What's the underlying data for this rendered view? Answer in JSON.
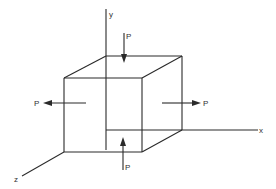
{
  "diagram": {
    "colors": {
      "line": "#2a2a2a",
      "text": "#333333",
      "background": "#ffffff"
    },
    "axes": {
      "x": {
        "label": "x"
      },
      "y": {
        "label": "y"
      },
      "z": {
        "label": "z"
      }
    },
    "forces": {
      "top": {
        "label": "P",
        "direction": "down"
      },
      "bottom": {
        "label": "P",
        "direction": "up"
      },
      "left": {
        "label": "P",
        "direction": "left"
      },
      "right": {
        "label": "P",
        "direction": "right"
      }
    }
  }
}
